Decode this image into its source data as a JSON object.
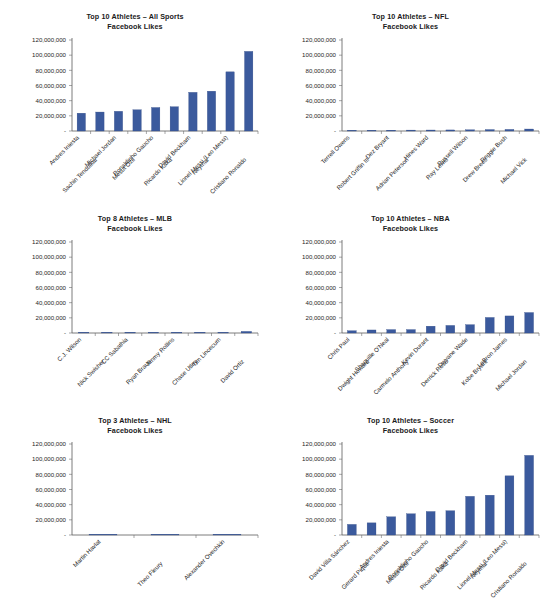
{
  "figure": {
    "subtitle_common": "Facebook Likes",
    "bar_color": "#3b5a9d",
    "axis_color": "#5a5a5a",
    "background": "#ffffff"
  },
  "chart_data": [
    {
      "id": "all-sports",
      "type": "bar",
      "title": "Top 10 Athletes – All Sports",
      "subtitle": "Facebook Likes",
      "xlabel": "",
      "ylabel": "",
      "ylim": [
        0,
        120000000
      ],
      "yticks": [
        0,
        20000000,
        40000000,
        60000000,
        80000000,
        100000000,
        120000000
      ],
      "ytick_labels": [
        "-",
        "20,000,000",
        "40,000,000",
        "60,000,000",
        "80,000,000",
        "100,000,000",
        "120,000,000"
      ],
      "grid": false,
      "legend": "none",
      "categories": [
        "Andres Iniesta",
        "Sachin Tendulkar",
        "Michael Jordan",
        "Mesut Özil",
        "Ronaldinho Gaucho",
        "Ricardo Kaka",
        "David Beckham",
        "Neymar",
        "Lionel Messi (Leo Messi)",
        "Cristiano Ronaldo"
      ],
      "values": [
        23500000,
        25000000,
        26000000,
        28000000,
        31000000,
        32000000,
        51000000,
        52500000,
        78000000,
        105000000
      ]
    },
    {
      "id": "nfl",
      "type": "bar",
      "title": "Top 10 Athletes – NFL",
      "subtitle": "Facebook Likes",
      "xlabel": "",
      "ylabel": "",
      "ylim": [
        0,
        120000000
      ],
      "yticks": [
        0,
        20000000,
        40000000,
        60000000,
        80000000,
        100000000,
        120000000
      ],
      "ytick_labels": [
        "-",
        "20,000,000",
        "40,000,000",
        "60,000,000",
        "80,000,000",
        "100,000,000",
        "120,000,000"
      ],
      "grid": false,
      "legend": "none",
      "categories": [
        "Terrell Owens",
        "Robert Griffin III",
        "Dez Bryant",
        "Adrian Peterson",
        "Hines Ward",
        "Ray Lewis",
        "Russell Wilson",
        "Drew Brees",
        "Reggie Bush",
        "Michael Vick"
      ],
      "values": [
        900000,
        1000000,
        1100000,
        1200000,
        1300000,
        1400000,
        1600000,
        1900000,
        2100000,
        2600000
      ]
    },
    {
      "id": "mlb",
      "type": "bar",
      "title": "Top 8 Athletes – MLB",
      "subtitle": "Facebook Likes",
      "xlabel": "",
      "ylabel": "",
      "ylim": [
        0,
        120000000
      ],
      "yticks": [
        0,
        20000000,
        40000000,
        60000000,
        80000000,
        100000000,
        120000000
      ],
      "ytick_labels": [
        "-",
        "20,000,000",
        "40,000,000",
        "60,000,000",
        "80,000,000",
        "100,000,000",
        "120,000,000"
      ],
      "grid": false,
      "legend": "none",
      "categories": [
        "C.J. Wilson",
        "Nick Swisher",
        "CC Sabathia",
        "Ryan Braun",
        "Jimmy Rollins",
        "Chase Utley",
        "Tim Lincecum",
        "David Ortiz"
      ],
      "values": [
        300000,
        350000,
        400000,
        450000,
        550000,
        650000,
        800000,
        2100000
      ]
    },
    {
      "id": "nba",
      "type": "bar",
      "title": "Top 10 Athletes – NBA",
      "subtitle": "Facebook Likes",
      "xlabel": "",
      "ylabel": "",
      "ylim": [
        0,
        120000000
      ],
      "yticks": [
        0,
        20000000,
        40000000,
        60000000,
        80000000,
        100000000,
        120000000
      ],
      "ytick_labels": [
        "-",
        "20,000,000",
        "40,000,000",
        "60,000,000",
        "80,000,000",
        "100,000,000",
        "120,000,000"
      ],
      "grid": false,
      "legend": "none",
      "categories": [
        "Chris Paul",
        "Dwight Howard",
        "Shaquille O'Neal",
        "Carmelo Anthony",
        "Kevin Durant",
        "Derrick Rose",
        "Dwyane Wade",
        "Kobe Bryant",
        "LeBron James",
        "Michael Jordan"
      ],
      "values": [
        3000000,
        4000000,
        4500000,
        4500000,
        9000000,
        10000000,
        11000000,
        20500000,
        22500000,
        27000000
      ]
    },
    {
      "id": "nhl",
      "type": "bar",
      "title": "Top 3 Athletes – NHL",
      "subtitle": "Facebook Likes",
      "xlabel": "",
      "ylabel": "",
      "ylim": [
        0,
        120000000
      ],
      "yticks": [
        0,
        20000000,
        40000000,
        60000000,
        80000000,
        100000000,
        120000000
      ],
      "ytick_labels": [
        "-",
        "20,000,000",
        "40,000,000",
        "60,000,000",
        "80,000,000",
        "100,000,000",
        "120,000,000"
      ],
      "grid": false,
      "legend": "none",
      "categories": [
        "Martin Havlat",
        "Theo Fleury",
        "Alexander Ovechkin"
      ],
      "values": [
        150000,
        200000,
        400000
      ]
    },
    {
      "id": "soccer",
      "type": "bar",
      "title": "Top 10 Athletes – Soccer",
      "subtitle": "Facebook Likes",
      "xlabel": "",
      "ylabel": "",
      "ylim": [
        0,
        120000000
      ],
      "yticks": [
        0,
        20000000,
        40000000,
        60000000,
        80000000,
        100000000,
        120000000
      ],
      "ytick_labels": [
        "-",
        "20,000,000",
        "40,000,000",
        "60,000,000",
        "80,000,000",
        "100,000,000",
        "120,000,000"
      ],
      "grid": false,
      "legend": "none",
      "categories": [
        "David Villa Sánchez",
        "Gerard Piqué",
        "Andres Iniesta",
        "Mesut Özil",
        "Ronaldinho Gaucho",
        "Ricardo Kaká",
        "David Beckham",
        "Neymar",
        "Lionel Messi (Leo Messi)",
        "Cristiano Ronaldo"
      ],
      "values": [
        14000000,
        16000000,
        24000000,
        28000000,
        31000000,
        32000000,
        51000000,
        52500000,
        78000000,
        105000000
      ]
    }
  ]
}
